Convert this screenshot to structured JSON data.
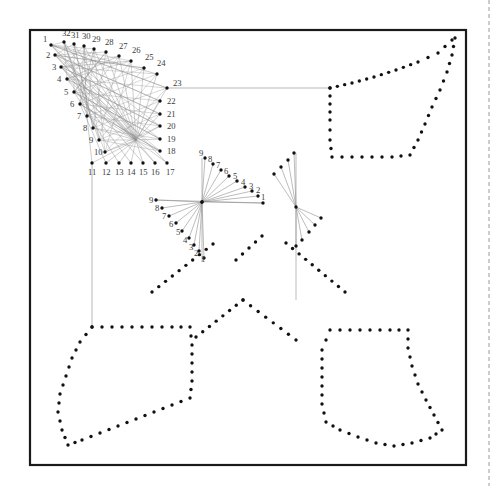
{
  "figure": {
    "title": "",
    "background": "#ffffff",
    "frame": {
      "x": 30,
      "y": 30,
      "width": 436,
      "height": 435,
      "stroke": "#1a1a1a",
      "stroke_width": 2.2
    },
    "page_edge_marker": {
      "x": 489,
      "y_start": 0,
      "y_end": 486,
      "stroke": "#9a9a9a",
      "dash": "4 3"
    },
    "colors": {
      "dot": "#111111",
      "envelope_line": "#8e8e8e",
      "connector_line": "#9a9a9a",
      "label": "#3a3a3a",
      "frame": "#1a1a1a"
    },
    "dot_radius": 1.7,
    "label_font_size": 8.6
  },
  "chart_data": {
    "type": "scatter",
    "title": "",
    "xlabel": "",
    "ylabel": "",
    "xlim": [
      30,
      466
    ],
    "ylim": [
      30,
      465
    ],
    "grid": false,
    "legend": null,
    "clusters": [
      {
        "name": "main-lattice",
        "point_count": 32,
        "label_sequence": [
          1,
          2,
          3,
          4,
          5,
          6,
          7,
          8,
          9,
          10,
          11,
          12,
          13,
          14,
          15,
          16,
          17,
          18,
          19,
          20,
          21,
          22,
          23,
          24,
          25,
          26,
          27,
          28,
          29,
          30,
          31,
          32
        ],
        "points": [
          {
            "n": 1,
            "x": 51,
            "y": 45,
            "lx": 43,
            "ly": 42
          },
          {
            "n": 2,
            "x": 55,
            "y": 55,
            "lx": 46,
            "ly": 58
          },
          {
            "n": 3,
            "x": 61,
            "y": 67,
            "lx": 52,
            "ly": 70
          },
          {
            "n": 4,
            "x": 67,
            "y": 79,
            "lx": 57,
            "ly": 82
          },
          {
            "n": 5,
            "x": 74,
            "y": 92,
            "lx": 64,
            "ly": 95
          },
          {
            "n": 6,
            "x": 80,
            "y": 104,
            "lx": 70,
            "ly": 107
          },
          {
            "n": 7,
            "x": 87,
            "y": 116,
            "lx": 77,
            "ly": 119
          },
          {
            "n": 8,
            "x": 93,
            "y": 128,
            "lx": 83,
            "ly": 131
          },
          {
            "n": 9,
            "x": 99,
            "y": 140,
            "lx": 89,
            "ly": 143
          },
          {
            "n": 10,
            "x": 105,
            "y": 152,
            "lx": 94,
            "ly": 155
          },
          {
            "n": 11,
            "x": 92,
            "y": 163,
            "lx": 88,
            "ly": 175
          },
          {
            "n": 12,
            "x": 106,
            "y": 163,
            "lx": 102,
            "ly": 175
          },
          {
            "n": 13,
            "x": 119,
            "y": 163,
            "lx": 115,
            "ly": 175
          },
          {
            "n": 14,
            "x": 131,
            "y": 163,
            "lx": 127,
            "ly": 175
          },
          {
            "n": 15,
            "x": 143,
            "y": 163,
            "lx": 139,
            "ly": 175
          },
          {
            "n": 16,
            "x": 155,
            "y": 163,
            "lx": 151,
            "ly": 175
          },
          {
            "n": 17,
            "x": 167,
            "y": 163,
            "lx": 166,
            "ly": 175
          },
          {
            "n": 18,
            "x": 160,
            "y": 151,
            "lx": 167,
            "ly": 154
          },
          {
            "n": 19,
            "x": 160,
            "y": 139,
            "lx": 167,
            "ly": 142
          },
          {
            "n": 20,
            "x": 160,
            "y": 126,
            "lx": 167,
            "ly": 129
          },
          {
            "n": 21,
            "x": 160,
            "y": 114,
            "lx": 167,
            "ly": 117
          },
          {
            "n": 22,
            "x": 160,
            "y": 101,
            "lx": 167,
            "ly": 104
          },
          {
            "n": 23,
            "x": 167,
            "y": 88,
            "lx": 173,
            "ly": 86
          },
          {
            "n": 24,
            "x": 157,
            "y": 74,
            "lx": 157,
            "ly": 66
          },
          {
            "n": 25,
            "x": 144,
            "y": 68,
            "lx": 145,
            "ly": 60
          },
          {
            "n": 26,
            "x": 131,
            "y": 61,
            "lx": 132,
            "ly": 53
          },
          {
            "n": 27,
            "x": 119,
            "y": 56,
            "lx": 119,
            "ly": 49
          },
          {
            "n": 28,
            "x": 106,
            "y": 52,
            "lx": 105,
            "ly": 45
          },
          {
            "n": 29,
            "x": 94,
            "y": 49,
            "lx": 92,
            "ly": 42
          },
          {
            "n": 30,
            "x": 84,
            "y": 46,
            "lx": 82,
            "ly": 39
          },
          {
            "n": 31,
            "x": 74,
            "y": 44,
            "lx": 71,
            "ly": 38
          },
          {
            "n": 32,
            "x": 64,
            "y": 42,
            "lx": 62,
            "ly": 36
          }
        ],
        "chords": "each point 1..10 on the left arm is joined to points 17..26 and 11..16 of the lower/right arms, producing a dense caustic envelope"
      },
      {
        "name": "centre-upper-fan",
        "hub": {
          "x": 202,
          "y": 202
        },
        "point_count": 9,
        "points": [
          {
            "n": 9,
            "x": 205,
            "y": 158,
            "lx": 199,
            "ly": 156
          },
          {
            "n": 8,
            "x": 213,
            "y": 164,
            "lx": 208,
            "ly": 162
          },
          {
            "n": 7,
            "x": 221,
            "y": 170,
            "lx": 216,
            "ly": 168
          },
          {
            "n": 6,
            "x": 229,
            "y": 176,
            "lx": 224,
            "ly": 174
          },
          {
            "n": 5,
            "x": 237,
            "y": 181,
            "lx": 233,
            "ly": 179
          },
          {
            "n": 4,
            "x": 245,
            "y": 187,
            "lx": 241,
            "ly": 185
          },
          {
            "n": 3,
            "x": 252,
            "y": 191,
            "lx": 249,
            "ly": 189
          },
          {
            "n": 2,
            "x": 258,
            "y": 196,
            "lx": 256,
            "ly": 193
          },
          {
            "n": 1,
            "x": 263,
            "y": 203,
            "lx": 261,
            "ly": 200
          }
        ]
      },
      {
        "name": "centre-lower-fan",
        "hub": {
          "x": 202,
          "y": 202
        },
        "point_count": 9,
        "points": [
          {
            "n": 9,
            "x": 156,
            "y": 200,
            "lx": 149,
            "ly": 203
          },
          {
            "n": 8,
            "x": 162,
            "y": 208,
            "lx": 155,
            "ly": 211
          },
          {
            "n": 7,
            "x": 169,
            "y": 216,
            "lx": 162,
            "ly": 219
          },
          {
            "n": 6,
            "x": 176,
            "y": 223,
            "lx": 169,
            "ly": 227
          },
          {
            "n": 5,
            "x": 182,
            "y": 231,
            "lx": 176,
            "ly": 235
          },
          {
            "n": 4,
            "x": 189,
            "y": 238,
            "lx": 183,
            "ly": 243
          },
          {
            "n": 3,
            "x": 194,
            "y": 245,
            "lx": 189,
            "ly": 250
          },
          {
            "n": 2,
            "x": 199,
            "y": 251,
            "lx": 194,
            "ly": 256
          },
          {
            "n": 1,
            "x": 204,
            "y": 258,
            "lx": 201,
            "ly": 262
          }
        ]
      },
      {
        "name": "right-fan",
        "hub": {
          "x": 296,
          "y": 207
        },
        "point_count": 9,
        "labels_shown": false,
        "points": [
          {
            "n": 9,
            "x": 294,
            "y": 153
          },
          {
            "n": 8,
            "x": 288,
            "y": 160
          },
          {
            "n": 7,
            "x": 281,
            "y": 167
          },
          {
            "n": 6,
            "x": 274,
            "y": 174
          },
          {
            "n": 5,
            "x": 296,
            "y": 246
          },
          {
            "n": 4,
            "x": 302,
            "y": 240
          },
          {
            "n": 3,
            "x": 309,
            "y": 232
          },
          {
            "n": 2,
            "x": 315,
            "y": 225
          },
          {
            "n": 1,
            "x": 321,
            "y": 218
          }
        ]
      }
    ],
    "connector_lines": [
      {
        "name": "line-23-to-ne-polygon",
        "x1": 167,
        "y1": 88,
        "x2": 330,
        "y2": 88
      },
      {
        "name": "line-11-to-sw-polygon",
        "x1": 92,
        "y1": 163,
        "x2": 92,
        "y2": 327
      }
    ],
    "dotted_polygons": [
      {
        "name": "ne-polygon",
        "vertices": [
          [
            330,
            88
          ],
          [
            352,
            83
          ],
          [
            374,
            77
          ],
          [
            396,
            70
          ],
          [
            418,
            62
          ],
          [
            438,
            53
          ],
          [
            452,
            40
          ],
          [
            455,
            38
          ],
          [
            452,
            55
          ],
          [
            447,
            72
          ],
          [
            440,
            90
          ],
          [
            432,
            107
          ],
          [
            425,
            124
          ],
          [
            418,
            140
          ],
          [
            410,
            155
          ],
          [
            392,
            157
          ],
          [
            372,
            157
          ],
          [
            352,
            157
          ],
          [
            332,
            157
          ],
          [
            330,
            140
          ],
          [
            330,
            120
          ],
          [
            330,
            104
          ]
        ],
        "dot_spacing": 9
      },
      {
        "name": "nw-inner-gap",
        "vertices": [],
        "dot_spacing": 9
      },
      {
        "name": "sw-polygon",
        "vertices": [
          [
            92,
            327
          ],
          [
            112,
            327
          ],
          [
            132,
            327
          ],
          [
            152,
            327
          ],
          [
            172,
            327
          ],
          [
            190,
            327
          ],
          [
            192,
            345
          ],
          [
            192,
            363
          ],
          [
            192,
            381
          ],
          [
            190,
            398
          ],
          [
            172,
            405
          ],
          [
            154,
            412
          ],
          [
            136,
            419
          ],
          [
            118,
            426
          ],
          [
            100,
            433
          ],
          [
            82,
            440
          ],
          [
            68,
            445
          ],
          [
            62,
            430
          ],
          [
            58,
            412
          ],
          [
            60,
            394
          ],
          [
            66,
            376
          ],
          [
            72,
            358
          ],
          [
            80,
            342
          ]
        ],
        "dot_spacing": 9
      },
      {
        "name": "se-polygon",
        "vertices": [
          [
            330,
            330
          ],
          [
            350,
            330
          ],
          [
            370,
            330
          ],
          [
            390,
            330
          ],
          [
            408,
            330
          ],
          [
            408,
            348
          ],
          [
            412,
            366
          ],
          [
            418,
            384
          ],
          [
            426,
            400
          ],
          [
            434,
            415
          ],
          [
            442,
            430
          ],
          [
            430,
            438
          ],
          [
            412,
            443
          ],
          [
            394,
            446
          ],
          [
            376,
            443
          ],
          [
            358,
            437
          ],
          [
            340,
            430
          ],
          [
            326,
            422
          ],
          [
            322,
            404
          ],
          [
            322,
            386
          ],
          [
            322,
            368
          ],
          [
            322,
            350
          ]
        ],
        "dot_spacing": 9
      }
    ],
    "dotted_diagonals": [
      {
        "name": "x-arm-upper-left",
        "x1": 152,
        "y1": 292,
        "x2": 213,
        "y2": 244
      },
      {
        "name": "x-arm-upper-right",
        "x1": 286,
        "y1": 243,
        "x2": 345,
        "y2": 292
      },
      {
        "name": "chevron-left",
        "x1": 196,
        "y1": 337,
        "x2": 243,
        "y2": 300
      },
      {
        "name": "chevron-right",
        "x1": 243,
        "y1": 300,
        "x2": 296,
        "y2": 340
      },
      {
        "name": "ne-tail",
        "x1": 236,
        "y1": 260,
        "x2": 262,
        "y2": 236
      }
    ]
  }
}
